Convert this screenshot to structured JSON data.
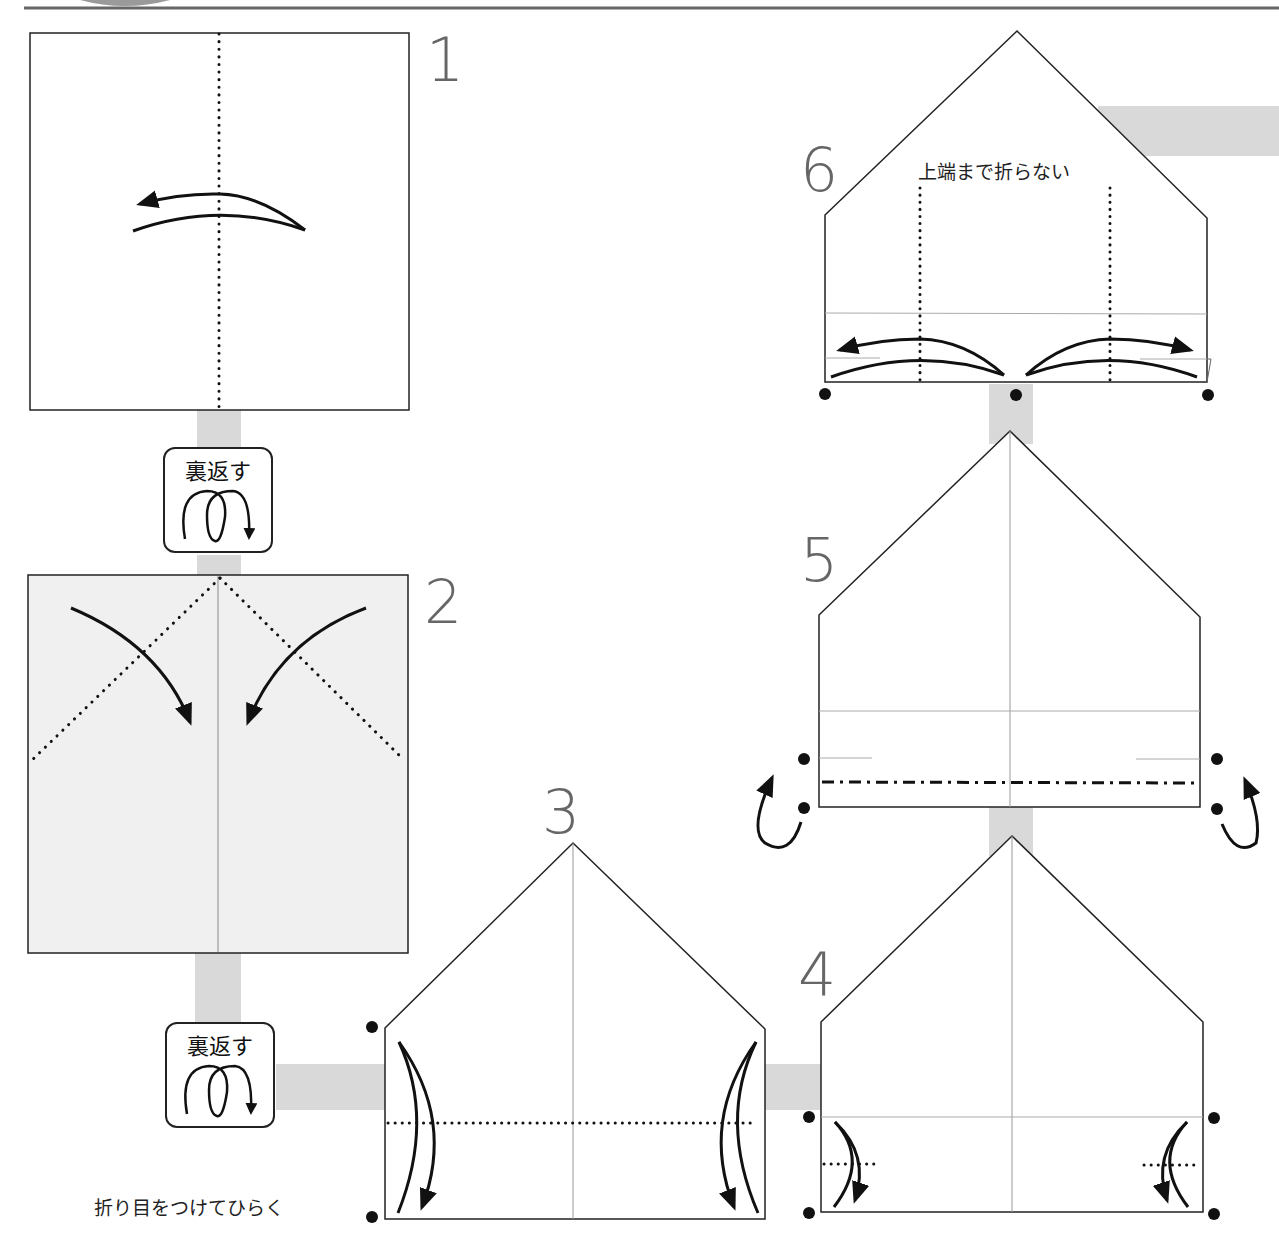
{
  "diagram": {
    "type": "origami-instructions",
    "colors": {
      "connector": "#d9d9d9",
      "paper_back": "#f0f0f0",
      "step_number": "#666666",
      "line": "#222222"
    },
    "steps": [
      {
        "number": "1",
        "instruction": ""
      },
      {
        "number": "2",
        "instruction": ""
      },
      {
        "number": "3",
        "instruction": ""
      },
      {
        "number": "4",
        "instruction": ""
      },
      {
        "number": "5",
        "instruction": ""
      },
      {
        "number": "6",
        "instruction": ""
      }
    ],
    "flip_badges": [
      {
        "label": "裏返す",
        "icon": "flip-over-loop-icon"
      },
      {
        "label": "裏返す",
        "icon": "flip-over-loop-icon"
      }
    ],
    "notes": {
      "step3_note": "折り目をつけてひらく",
      "step6_note": "上端まで折らない"
    }
  }
}
